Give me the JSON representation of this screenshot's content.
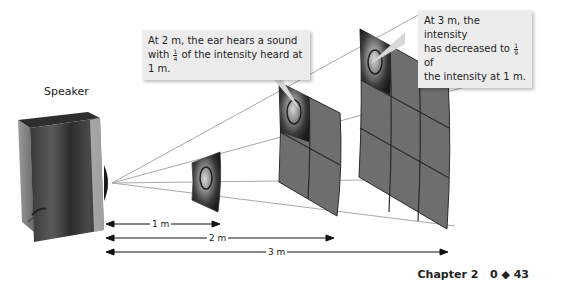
{
  "diagram": {
    "speaker_label": "Speaker",
    "callouts": [
      {
        "id": "callout-2m",
        "text_before": "At 2 m, the ear hears a sound with",
        "fraction": {
          "numerator": "1",
          "denominator": "4"
        },
        "text_after": "of the intensity heard at 1 m."
      },
      {
        "id": "callout-3m",
        "line1": "At 3 m, the intensity",
        "line2_before": "has decreased to",
        "fraction": {
          "numerator": "1",
          "denominator": "9"
        },
        "line2_after": "of",
        "line3": "the intensity at 1 m."
      }
    ],
    "distances": [
      {
        "label": "1 m"
      },
      {
        "label": "2 m"
      },
      {
        "label": "3 m"
      }
    ],
    "panels": [
      {
        "distance": "1 m",
        "grid": "1x1"
      },
      {
        "distance": "2 m",
        "grid": "2x2"
      },
      {
        "distance": "3 m",
        "grid": "3x3"
      }
    ],
    "colors": {
      "panel_fill": "#6e6e6e",
      "panel_grid": "#2a2a2a",
      "callout_bg": "#ececec",
      "ray": "#9a9a9a"
    }
  },
  "footer": {
    "chapter": "Chapter 2",
    "section": "0",
    "separator": "◆",
    "page": "43"
  }
}
